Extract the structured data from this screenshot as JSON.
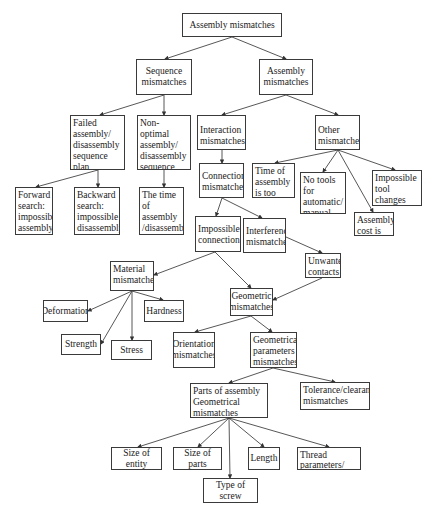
{
  "diagram": {
    "type": "hierarchy-tree",
    "nodes": [
      {
        "id": "root",
        "label": "Assembly mismatches"
      },
      {
        "id": "seq",
        "label": "Sequence mismatches"
      },
      {
        "id": "asm",
        "label": "Assembly mismatches"
      },
      {
        "id": "failed",
        "label": "Failed assembly/ disassembly sequence plan"
      },
      {
        "id": "nonopt",
        "label": "Non-optimal assembly/ disassembly sequence plan"
      },
      {
        "id": "interaction",
        "label": "Interaction mismatches"
      },
      {
        "id": "other",
        "label": "Other mismatches"
      },
      {
        "id": "forward",
        "label": "Forward search: impossible assembly"
      },
      {
        "id": "backward",
        "label": "Backward search: impossible disassembly"
      },
      {
        "id": "timeasm",
        "label": "The time of assembly /disassembly is too much"
      },
      {
        "id": "connection",
        "label": "Connection mismatches"
      },
      {
        "id": "timeother",
        "label": "Time of assembly is too much"
      },
      {
        "id": "notools",
        "label": "No tools for automatic/ manual assembly"
      },
      {
        "id": "toolchange",
        "label": "Impossible tool changes operation"
      },
      {
        "id": "cost",
        "label": "Assembly cost is high"
      },
      {
        "id": "impconn",
        "label": "Impossible connection"
      },
      {
        "id": "interference",
        "label": "Interference mismatches"
      },
      {
        "id": "unwanted",
        "label": "Unwanted contacts"
      },
      {
        "id": "material",
        "label": "Material mismatches"
      },
      {
        "id": "geometric",
        "label": "Geometric mismatches"
      },
      {
        "id": "deformation",
        "label": "Deformation"
      },
      {
        "id": "hardness",
        "label": "Hardness"
      },
      {
        "id": "strength",
        "label": "Strength"
      },
      {
        "id": "stress",
        "label": "Stress"
      },
      {
        "id": "orientation",
        "label": "Orientation mismatches"
      },
      {
        "id": "geoparams",
        "label": "Geometrical parameters mismatches"
      },
      {
        "id": "parts",
        "label": "Parts of assembly Geometrical mismatches"
      },
      {
        "id": "tolerance",
        "label": "Tolerance/clearance mismatches"
      },
      {
        "id": "sizeentity",
        "label": "Size of entity"
      },
      {
        "id": "sizeparts",
        "label": "Size of parts"
      },
      {
        "id": "length",
        "label": "Length"
      },
      {
        "id": "thread",
        "label": "Thread parameters/ type"
      },
      {
        "id": "screw",
        "label": "Type of screw"
      }
    ],
    "edges": [
      [
        "root",
        "seq"
      ],
      [
        "root",
        "asm"
      ],
      [
        "seq",
        "failed"
      ],
      [
        "seq",
        "nonopt"
      ],
      [
        "asm",
        "interaction"
      ],
      [
        "asm",
        "other"
      ],
      [
        "failed",
        "forward"
      ],
      [
        "failed",
        "backward"
      ],
      [
        "nonopt",
        "timeasm"
      ],
      [
        "interaction",
        "connection"
      ],
      [
        "other",
        "timeother"
      ],
      [
        "other",
        "notools"
      ],
      [
        "other",
        "cost"
      ],
      [
        "other",
        "toolchange"
      ],
      [
        "connection",
        "impconn"
      ],
      [
        "connection",
        "interference"
      ],
      [
        "interference",
        "unwanted"
      ],
      [
        "impconn",
        "material"
      ],
      [
        "impconn",
        "geometric"
      ],
      [
        "unwanted",
        "geometric"
      ],
      [
        "material",
        "deformation"
      ],
      [
        "material",
        "strength"
      ],
      [
        "material",
        "stress"
      ],
      [
        "material",
        "hardness"
      ],
      [
        "geometric",
        "orientation"
      ],
      [
        "geometric",
        "geoparams"
      ],
      [
        "geoparams",
        "parts"
      ],
      [
        "geoparams",
        "tolerance"
      ],
      [
        "parts",
        "sizeentity"
      ],
      [
        "parts",
        "sizeparts"
      ],
      [
        "parts",
        "screw"
      ],
      [
        "parts",
        "length"
      ],
      [
        "parts",
        "thread"
      ]
    ]
  }
}
